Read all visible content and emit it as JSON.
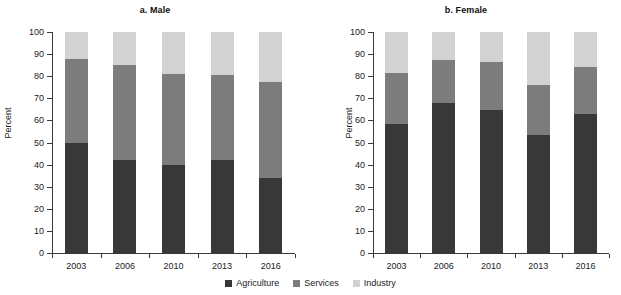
{
  "figure": {
    "clipped_header": "",
    "ylabel": "Percent",
    "colors": {
      "agriculture": "#383838",
      "services": "#7c7c7c",
      "industry": "#d2d2d2"
    }
  },
  "legend": {
    "position": "bottom-center",
    "items": [
      {
        "label": "Agriculture",
        "key": "agriculture"
      },
      {
        "label": "Services",
        "key": "services"
      },
      {
        "label": "Industry",
        "key": "industry"
      }
    ]
  },
  "yaxis": {
    "label": "Percent",
    "min": 0,
    "max": 100,
    "step": 10,
    "ticks": [
      "0",
      "10",
      "20",
      "30",
      "40",
      "50",
      "60",
      "70",
      "80",
      "90",
      "100"
    ]
  },
  "panels": [
    {
      "id": "male",
      "title": "a. Male"
    },
    {
      "id": "female",
      "title": "b. Female"
    }
  ],
  "chart_data": [
    {
      "type": "bar",
      "stacked": true,
      "title": "a. Male",
      "xlabel": "",
      "ylabel": "Percent",
      "ylim": [
        0,
        100
      ],
      "grid": false,
      "legend_position": "bottom-center",
      "categories": [
        "2003",
        "2006",
        "2010",
        "2013",
        "2016"
      ],
      "series": [
        {
          "name": "Agriculture",
          "color": "#383838",
          "values": [
            50.0,
            42.0,
            40.0,
            42.0,
            34.0
          ]
        },
        {
          "name": "Services",
          "color": "#7c7c7c",
          "values": [
            38.0,
            43.0,
            41.0,
            38.5,
            43.5
          ]
        },
        {
          "name": "Industry",
          "color": "#d2d2d2",
          "values": [
            12.0,
            15.0,
            19.0,
            19.5,
            22.5
          ]
        }
      ],
      "cumulative_tops": {
        "agriculture": [
          50.0,
          42.0,
          40.0,
          42.0,
          34.0
        ],
        "services": [
          88.0,
          85.0,
          81.0,
          80.5,
          77.5
        ],
        "industry": [
          100.0,
          100.0,
          100.0,
          100.0,
          100.0
        ]
      }
    },
    {
      "type": "bar",
      "stacked": true,
      "title": "b. Female",
      "xlabel": "",
      "ylabel": "Percent",
      "ylim": [
        0,
        100
      ],
      "grid": false,
      "legend_position": "bottom-center",
      "categories": [
        "2003",
        "2006",
        "2010",
        "2013",
        "2016"
      ],
      "series": [
        {
          "name": "Agriculture",
          "color": "#383838",
          "values": [
            58.5,
            68.0,
            64.5,
            53.5,
            63.0
          ]
        },
        {
          "name": "Services",
          "color": "#7c7c7c",
          "values": [
            23.0,
            19.5,
            22.0,
            22.5,
            21.0
          ]
        },
        {
          "name": "Industry",
          "color": "#d2d2d2",
          "values": [
            18.5,
            12.5,
            13.5,
            24.0,
            16.0
          ]
        }
      ],
      "cumulative_tops": {
        "agriculture": [
          58.5,
          68.0,
          64.5,
          53.5,
          63.0
        ],
        "services": [
          81.5,
          87.5,
          86.5,
          76.0,
          84.0
        ],
        "industry": [
          100.0,
          100.0,
          100.0,
          100.0,
          100.0
        ]
      }
    }
  ]
}
